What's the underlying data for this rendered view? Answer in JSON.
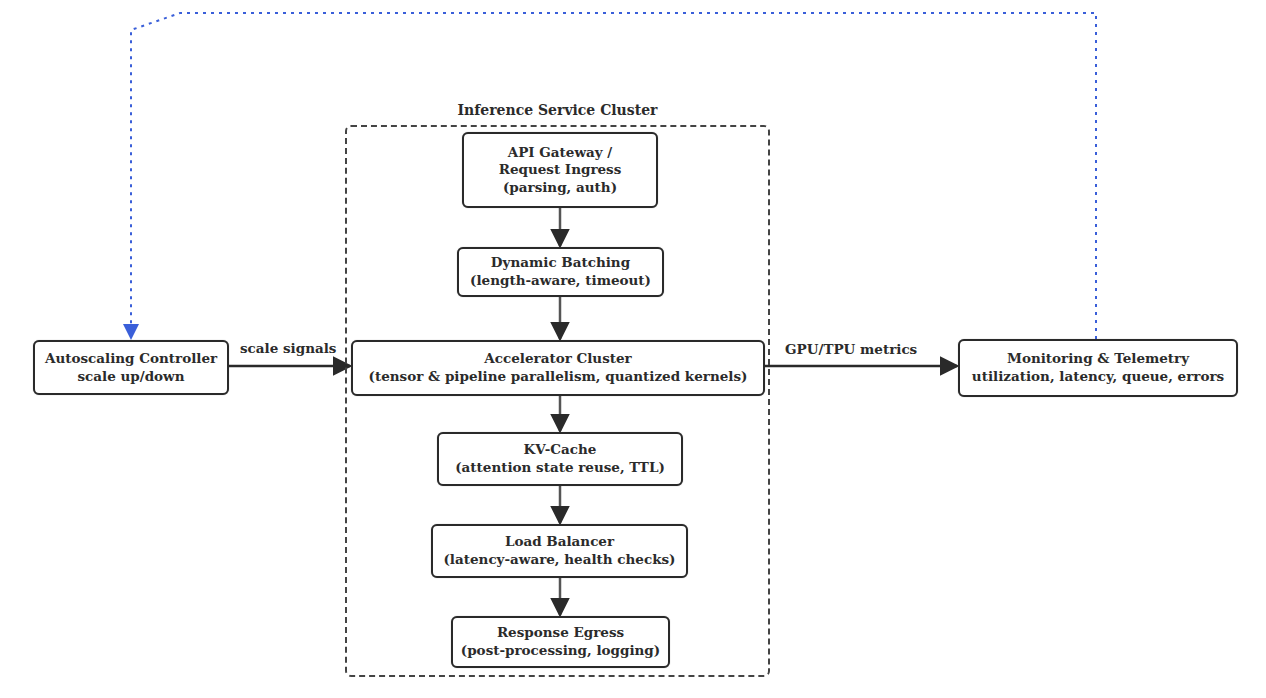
{
  "diagram": {
    "cluster": {
      "title": "Inference Service Cluster"
    },
    "nodes": {
      "api_gateway": {
        "lines": [
          "API Gateway /",
          "Request Ingress",
          "(parsing, auth)"
        ]
      },
      "dynamic_batching": {
        "lines": [
          "Dynamic Batching",
          "(length-aware, timeout)"
        ]
      },
      "accelerator_cluster": {
        "lines": [
          "Accelerator Cluster",
          "(tensor & pipeline parallelism, quantized kernels)"
        ]
      },
      "kv_cache": {
        "lines": [
          "KV-Cache",
          "(attention state reuse, TTL)"
        ]
      },
      "load_balancer": {
        "lines": [
          "Load Balancer",
          "(latency-aware, health checks)"
        ]
      },
      "response_egress": {
        "lines": [
          "Response Egress",
          "(post-processing, logging)"
        ]
      },
      "autoscaling_controller": {
        "lines": [
          "Autoscaling Controller",
          "scale up/down"
        ]
      },
      "monitoring": {
        "lines": [
          "Monitoring & Telemetry",
          "utilization, latency, queue, errors"
        ]
      }
    },
    "edges": {
      "scale_signals": "scale signals",
      "gpu_tpu_metrics": "GPU/TPU metrics"
    },
    "colors": {
      "feedback_line": "#3a5fd9",
      "box_border": "#2a2a2a"
    }
  }
}
